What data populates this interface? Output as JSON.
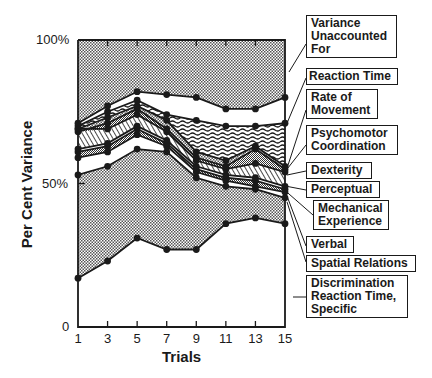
{
  "chart_data": {
    "type": "area",
    "title": "",
    "xlabel": "Trials",
    "ylabel": "Per Cent Variance",
    "x": [
      1,
      3,
      5,
      7,
      9,
      11,
      13,
      15
    ],
    "xticks": [
      "1",
      "3",
      "5",
      "7",
      "9",
      "11",
      "13",
      "15"
    ],
    "yticks": [
      "0",
      "50%",
      "100%"
    ],
    "ylim": [
      0,
      100
    ],
    "stacked_cumulative": true,
    "series": [
      {
        "name": "Discrimination Reaction Time, Specific",
        "cumulative": [
          17,
          23,
          31,
          27,
          27,
          36,
          38,
          36
        ]
      },
      {
        "name": "Spatial Relations",
        "cumulative": [
          53,
          56,
          62,
          61,
          52,
          49,
          48,
          45
        ]
      },
      {
        "name": "Verbal",
        "cumulative": [
          59,
          61,
          67,
          63,
          54,
          51,
          49,
          47
        ]
      },
      {
        "name": "Mechanical Experience",
        "cumulative": [
          61,
          63,
          69,
          64,
          55,
          52,
          51,
          48
        ]
      },
      {
        "name": "Perceptual",
        "cumulative": [
          62,
          64,
          70,
          65,
          56,
          53,
          52,
          49
        ]
      },
      {
        "name": "Dexterity",
        "cumulative": [
          69,
          69,
          74,
          68,
          58,
          55,
          57,
          54
        ]
      },
      {
        "name": "Psychomotor Coordination",
        "cumulative": [
          68,
          71,
          76,
          69,
          59,
          56,
          62,
          55
        ]
      },
      {
        "name": "Rate of Movement",
        "cumulative": [
          69,
          73,
          77,
          72,
          61,
          58,
          63,
          56
        ]
      },
      {
        "name": "Reaction Time",
        "cumulative": [
          70,
          75,
          79,
          74,
          72,
          70,
          70,
          71
        ]
      },
      {
        "name": "Variance Unaccounted For",
        "cumulative_lower": [
          71,
          77,
          82,
          81,
          80,
          76,
          76,
          80
        ],
        "cumulative_upper": [
          100,
          100,
          100,
          100,
          100,
          100,
          100,
          100
        ]
      }
    ],
    "grid": false,
    "legend_position": "right"
  },
  "axes": {
    "y_title": "Per Cent Variance",
    "x_title": "Trials",
    "y_ticks": {
      "top": "100%",
      "mid": "50%",
      "bottom": "0"
    },
    "x_ticks": [
      "1",
      "3",
      "5",
      "7",
      "9",
      "11",
      "13",
      "15"
    ]
  },
  "labels": {
    "unaccounted": [
      "Variance",
      "Unaccounted",
      "For"
    ],
    "reaction_time": "Reaction Time",
    "rate_of_movement": [
      "Rate of",
      "Movement"
    ],
    "psychomotor": [
      "Psychomotor",
      "Coordination"
    ],
    "dexterity": "Dexterity",
    "perceptual": "Perceptual",
    "mechanical": [
      "Mechanical",
      "Experience"
    ],
    "verbal": "Verbal",
    "spatial": "Spatial Relations",
    "discrimination": [
      "Discrimination",
      "Reaction Time,",
      "Specific"
    ]
  }
}
